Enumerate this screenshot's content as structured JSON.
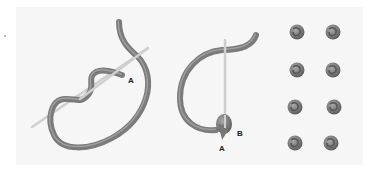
{
  "colors": {
    "thread": "#7b7b7b",
    "thread_highlight": "#a5a5a5",
    "needle": "#cfcfcf",
    "panel": "#f6f6f6",
    "label": "#222222"
  },
  "panels": [
    {
      "name": "step-1-wrap",
      "labels": [
        {
          "text": "A"
        }
      ]
    },
    {
      "name": "step-2-insert",
      "labels": [
        {
          "text": "B"
        },
        {
          "text": "A"
        }
      ]
    },
    {
      "name": "finished-knots",
      "knot_count": 8,
      "rows": 4,
      "cols": 2
    }
  ]
}
